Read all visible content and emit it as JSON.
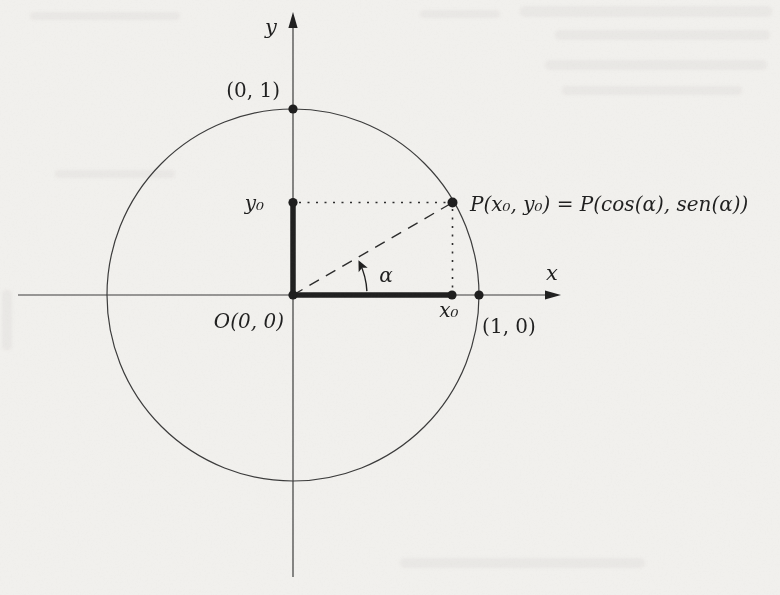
{
  "figure": {
    "colors": {
      "paper": "#f2f1ee",
      "ink": "#1e1e1e",
      "line": "#3a3a3a"
    },
    "labels": {
      "y_axis": "y",
      "x_axis": "x",
      "top_point": "(0, 1)",
      "right_point": "(1, 0)",
      "origin": "O(0, 0)",
      "y0": "y₀",
      "x0": "x₀",
      "angle": "α",
      "point_p": "P(x₀, y₀) = P(cos(α), sen(α))"
    }
  }
}
